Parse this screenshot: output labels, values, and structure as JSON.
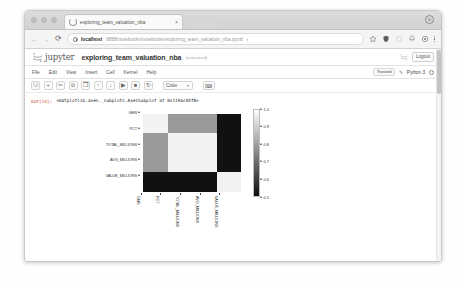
{
  "browser": {
    "tab": {
      "title": "exploring_team_valuation_nba",
      "close_label": "×"
    },
    "nav": {
      "back": "←",
      "forward": "→",
      "reload": "⟳"
    },
    "url": {
      "host": "localhost",
      "rest": ":8888/notebooks/notebooks/exploring_team_valuation_nba.ipynb",
      "trailing_mark": "‹"
    }
  },
  "jupyter": {
    "brand": "jupyter",
    "notebook_title": "exploring_team_valuation_nba",
    "saved_status": "(autosaved)",
    "logout_label": "Logout",
    "menu": [
      "File",
      "Edit",
      "View",
      "Insert",
      "Cell",
      "Kernel",
      "Help"
    ],
    "trusted_label": "Trusted",
    "kernel_name": "Python 3",
    "toolbar": {
      "save": "🖫",
      "insert": "+",
      "cut": "✂",
      "copy": "⧉",
      "paste": "❐",
      "move_up": "↑",
      "move_down": "↓",
      "run": "▶",
      "stop": "■",
      "restart": "↻",
      "cell_type": "Code",
      "caret": "▾",
      "command_palette": "⌨"
    }
  },
  "cell": {
    "prompt": "Out[14]:",
    "output_text": "<matplotlib.axes._subplots.AxesSubplot at 0x119ac05f8>"
  },
  "chart_data": {
    "type": "heatmap",
    "title": "",
    "xlabel": "",
    "ylabel": "",
    "categories": [
      "GMS",
      "PCT",
      "TOTAL_MILLIONS",
      "AVG_MILLIONS",
      "VALUE_MILLIONS"
    ],
    "colormap": "gray",
    "colorbar": {
      "ticks": [
        1.0,
        0.9,
        0.8,
        0.7,
        0.6,
        0.5
      ],
      "tick_labels": [
        "1.0",
        "0.9",
        "0.8",
        "0.7",
        "0.6",
        "0.5"
      ],
      "vmin": 0.5,
      "vmax": 1.0,
      "position": "right"
    },
    "rows": [
      "PCT",
      "TOTAL_MILLIONS",
      "AVG_MILLIONS",
      "VALUE_MILLIONS"
    ],
    "columns": [
      "PCT",
      "TOTAL_MILLIONS",
      "AVG_MILLIONS",
      "VALUE_MILLIONS"
    ],
    "matrix": [
      [
        1.0,
        0.78,
        0.78,
        0.5
      ],
      [
        0.78,
        1.0,
        1.0,
        0.5
      ],
      [
        0.78,
        1.0,
        1.0,
        0.5
      ],
      [
        0.5,
        0.5,
        0.5,
        1.0
      ]
    ],
    "cell_colors": [
      [
        "#f2f2f2",
        "#9a9a9a",
        "#9a9a9a",
        "#111111"
      ],
      [
        "#9a9a9a",
        "#f2f2f2",
        "#f2f2f2",
        "#111111"
      ],
      [
        "#9a9a9a",
        "#f2f2f2",
        "#f2f2f2",
        "#111111"
      ],
      [
        "#111111",
        "#111111",
        "#111111",
        "#f2f2f2"
      ]
    ]
  }
}
